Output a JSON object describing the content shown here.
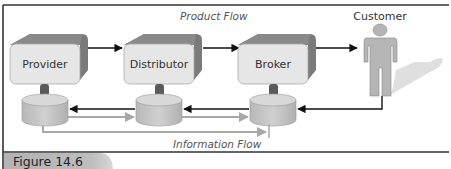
{
  "figure": {
    "label": "Figure 14.6"
  },
  "flows": {
    "product_flow": "Product Flow",
    "information_flow": "Information Flow"
  },
  "nodes": [
    {
      "id": "provider",
      "label": "Provider"
    },
    {
      "id": "distributor",
      "label": "Distributor"
    },
    {
      "id": "broker",
      "label": "Broker"
    }
  ],
  "customer": {
    "label": "Customer"
  },
  "colors": {
    "box_face": "#e6e6e6",
    "box_side": "#7a7a7a",
    "db_body": "#c4c4c4",
    "db_top": "#d8d8d8",
    "connector": "#5a5a5a",
    "arrow_black": "#111111",
    "arrow_gray": "#a8a8a8",
    "figure_tab": "#b0b0b0",
    "customer_body": "#b5b5b5",
    "customer_shadow": "#dcdcdc"
  }
}
